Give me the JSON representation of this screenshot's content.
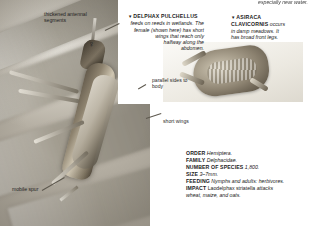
{
  "page": {
    "domain_note": "field guide spread: planthoppers (Delphacidae)"
  },
  "photos": {
    "main": {
      "name": "delphax-pulchellus-photo",
      "subject": "Delphax pulchellus female on reed stem"
    },
    "inset": {
      "name": "asiraca-clavicornis-photo",
      "subject": "Asiraca clavicornis adult"
    }
  },
  "captions": {
    "top_cut": "especially near water.",
    "delphax": {
      "marker": "▼",
      "headword": "DELPHAX PULCHELLUS",
      "body_lines": [
        "feeds on reeds in wetlands. The",
        "female (shown here) has short",
        "wings that reach only",
        "halfway along the",
        "abdomen."
      ],
      "body": "feeds on reeds in wetlands. The female (shown here) has short wings that reach only halfway along the abdomen."
    },
    "asiraca": {
      "marker": "▼",
      "headword_line1": "ASIRACA",
      "headword_line2": "CLAVICORNIS",
      "body_lines": [
        "occurs",
        "in damp meadows. It",
        "has broad front legs."
      ],
      "body": "occurs in damp meadows. It has broad front legs."
    }
  },
  "callouts": {
    "antennal_segments": "thickened antennal segments",
    "parallel_sides": "parallel sides to body",
    "short_wings": "short wings",
    "mobile_spur": "mobile spur",
    "female_symbol": "♀"
  },
  "fact_box": {
    "rows": [
      {
        "label": "ORDER",
        "value": "Hemiptera.",
        "style": "italic"
      },
      {
        "label": "FAMILY",
        "value": "Delphacidae.",
        "style": "italic"
      },
      {
        "label": "NUMBER OF SPECIES",
        "value": "1,800.",
        "style": "italic"
      },
      {
        "label": "SIZE",
        "value": "3–7mm.",
        "style": "italic"
      },
      {
        "label": "FEEDING",
        "value": "Nymphs and adults: herbivores.",
        "style": "italic"
      },
      {
        "label": "IMPACT",
        "value": "Laodelphax striatella attacks wheat, maize, and oats.",
        "style": "mixed"
      }
    ],
    "impact_roman_prefix": "Laodelphax striatella",
    "impact_italic_rest": " attacks",
    "impact_line2": "wheat, maize, and oats."
  },
  "colors": {
    "text": "#1b1b1b",
    "panel_bg": "#ffffff",
    "leader": "#5d584e"
  }
}
